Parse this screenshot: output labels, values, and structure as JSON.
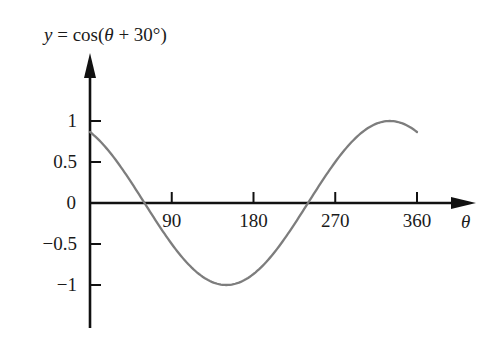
{
  "chart_data": {
    "type": "line",
    "title": "y = cos(θ + 30°)",
    "title_parts": {
      "y": "y",
      "eq": " = cos(",
      "theta": "θ",
      "rest": " + 30°)"
    },
    "xlabel": "θ",
    "ylabel": "y",
    "xlim": [
      0,
      360
    ],
    "ylim": [
      -1,
      1
    ],
    "grid": false,
    "legend": null,
    "x_ticks": [
      90,
      180,
      270,
      360
    ],
    "x_tick_labels": [
      "90",
      "180",
      "270",
      "360"
    ],
    "y_ticks": [
      1,
      0.5,
      0,
      -0.5,
      -1
    ],
    "y_tick_labels": [
      "1",
      "0.5",
      "0",
      "−0.5",
      "−1"
    ],
    "series": [
      {
        "name": "cos(θ + 30°)",
        "color": "#7d7d7d",
        "function": "cos(theta + 30deg)",
        "x": [
          0,
          30,
          60,
          90,
          120,
          150,
          180,
          210,
          240,
          270,
          300,
          330,
          360
        ],
        "values": [
          0.866,
          0.5,
          0,
          -0.5,
          -0.866,
          -1,
          -0.866,
          -0.5,
          0,
          0.5,
          0.866,
          1,
          0.866
        ]
      }
    ],
    "axis_color": "#111111"
  }
}
